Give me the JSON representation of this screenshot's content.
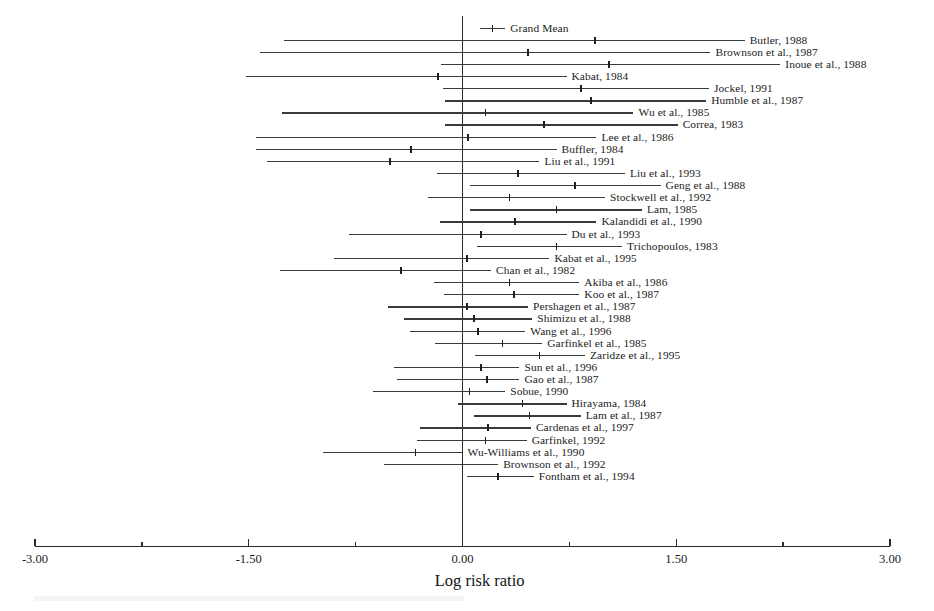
{
  "chart_data": {
    "type": "forest",
    "title": "",
    "xlabel": "Log risk ratio",
    "ylabel": "",
    "xlim": [
      -3.0,
      3.0
    ],
    "xticks": [
      -3.0,
      -1.5,
      0.0,
      1.5,
      3.0
    ],
    "xtick_labels": [
      "-3.00",
      "-1.50",
      "0.00",
      "1.50",
      "3.00"
    ],
    "minor_ticks": [
      -2.25,
      -0.75,
      0.75,
      2.25
    ],
    "grid": false,
    "legend": "none",
    "reference_line": 0.0,
    "summary": {
      "label": "Grand Mean",
      "estimate": 0.21,
      "ci_low": 0.12,
      "ci_high": 0.3,
      "label_side": "right"
    },
    "studies": [
      {
        "label": "Butler, 1988",
        "estimate": 0.93,
        "ci_low": -1.25,
        "ci_high": 1.98,
        "label_side": "right"
      },
      {
        "label": "Brownson et al., 1987",
        "estimate": 0.46,
        "ci_low": -1.42,
        "ci_high": 1.74,
        "label_side": "right"
      },
      {
        "label": "Inoue et al., 1988",
        "estimate": 1.03,
        "ci_low": -0.15,
        "ci_high": 2.23,
        "label_side": "right"
      },
      {
        "label": "Kabat, 1984",
        "estimate": -0.17,
        "ci_low": -1.52,
        "ci_high": 0.73,
        "label_side": "right"
      },
      {
        "label": "Jockel, 1991",
        "estimate": 0.83,
        "ci_low": -0.14,
        "ci_high": 1.73,
        "label_side": "right"
      },
      {
        "label": "Humble et al., 1987",
        "estimate": 0.9,
        "ci_low": -0.12,
        "ci_high": 1.71,
        "label_side": "right"
      },
      {
        "label": "Wu et al., 1985",
        "estimate": 0.16,
        "ci_low": -1.27,
        "ci_high": 1.2,
        "label_side": "right"
      },
      {
        "label": "Correa, 1983",
        "estimate": 0.57,
        "ci_low": -0.12,
        "ci_high": 1.51,
        "label_side": "right"
      },
      {
        "label": "Lee et al., 1986",
        "estimate": 0.04,
        "ci_low": -1.45,
        "ci_high": 0.94,
        "label_side": "right"
      },
      {
        "label": "Buffler, 1984",
        "estimate": -0.36,
        "ci_low": -1.45,
        "ci_high": 0.66,
        "label_side": "right"
      },
      {
        "label": "Liu et al., 1991",
        "estimate": -0.51,
        "ci_low": -1.37,
        "ci_high": 0.54,
        "label_side": "right"
      },
      {
        "label": "Liu et al., 1993",
        "estimate": 0.39,
        "ci_low": -0.18,
        "ci_high": 1.14,
        "label_side": "right"
      },
      {
        "label": "Geng et al., 1988",
        "estimate": 0.79,
        "ci_low": 0.05,
        "ci_high": 1.39,
        "label_side": "right"
      },
      {
        "label": "Stockwell et al., 1992",
        "estimate": 0.33,
        "ci_low": -0.24,
        "ci_high": 1.0,
        "label_side": "right"
      },
      {
        "label": "Lam, 1985",
        "estimate": 0.66,
        "ci_low": 0.05,
        "ci_high": 1.26,
        "label_side": "right"
      },
      {
        "label": "Kalandidi et al., 1990",
        "estimate": 0.37,
        "ci_low": -0.16,
        "ci_high": 0.94,
        "label_side": "right"
      },
      {
        "label": "Du et al., 1993",
        "estimate": 0.13,
        "ci_low": -0.8,
        "ci_high": 0.73,
        "label_side": "right"
      },
      {
        "label": "Trichopoulos, 1983",
        "estimate": 0.66,
        "ci_low": 0.1,
        "ci_high": 1.12,
        "label_side": "right"
      },
      {
        "label": "Kabat et al., 1995",
        "estimate": 0.03,
        "ci_low": -0.9,
        "ci_high": 0.61,
        "label_side": "right"
      },
      {
        "label": "Chan et al., 1982",
        "estimate": -0.43,
        "ci_low": -1.28,
        "ci_high": 0.2,
        "label_side": "right"
      },
      {
        "label": "Akiba et al., 1986",
        "estimate": 0.33,
        "ci_low": -0.2,
        "ci_high": 0.82,
        "label_side": "right"
      },
      {
        "label": "Koo et al., 1987",
        "estimate": 0.36,
        "ci_low": -0.13,
        "ci_high": 0.82,
        "label_side": "right"
      },
      {
        "label": "Pershagen et al., 1987",
        "estimate": 0.03,
        "ci_low": -0.52,
        "ci_high": 0.46,
        "label_side": "right"
      },
      {
        "label": "Shimizu et al., 1988",
        "estimate": 0.08,
        "ci_low": -0.41,
        "ci_high": 0.49,
        "label_side": "right"
      },
      {
        "label": "Wang et al., 1996",
        "estimate": 0.11,
        "ci_low": -0.37,
        "ci_high": 0.44,
        "label_side": "right"
      },
      {
        "label": "Garfinkel et al., 1985",
        "estimate": 0.28,
        "ci_low": -0.19,
        "ci_high": 0.56,
        "label_side": "right"
      },
      {
        "label": "Zaridze et al., 1995",
        "estimate": 0.54,
        "ci_low": 0.09,
        "ci_high": 0.86,
        "label_side": "right"
      },
      {
        "label": "Sun et al., 1996",
        "estimate": 0.13,
        "ci_low": -0.48,
        "ci_high": 0.4,
        "label_side": "right"
      },
      {
        "label": "Gao et al., 1987",
        "estimate": 0.17,
        "ci_low": -0.46,
        "ci_high": 0.4,
        "label_side": "right"
      },
      {
        "label": "Sobue, 1990",
        "estimate": 0.05,
        "ci_low": -0.63,
        "ci_high": 0.3,
        "label_side": "right"
      },
      {
        "label": "Hirayama, 1984",
        "estimate": 0.42,
        "ci_low": -0.03,
        "ci_high": 0.73,
        "label_side": "right"
      },
      {
        "label": "Lam et al., 1987",
        "estimate": 0.47,
        "ci_low": 0.08,
        "ci_high": 0.83,
        "label_side": "right"
      },
      {
        "label": "Cardenas et al., 1997",
        "estimate": 0.18,
        "ci_low": -0.3,
        "ci_high": 0.48,
        "label_side": "right"
      },
      {
        "label": "Garfinkel, 1992",
        "estimate": 0.16,
        "ci_low": -0.32,
        "ci_high": 0.45,
        "label_side": "right"
      },
      {
        "label": "Wu-Williams et al., 1990",
        "estimate": -0.33,
        "ci_low": -0.98,
        "ci_high": 0.0,
        "label_side": "right"
      },
      {
        "label": "Brownson et al., 1992",
        "estimate": 0.0,
        "ci_low": -0.55,
        "ci_high": 0.25,
        "label_side": "right"
      },
      {
        "label": "Fontham et al., 1994",
        "estimate": 0.25,
        "ci_low": 0.03,
        "ci_high": 0.5,
        "label_side": "right"
      }
    ]
  }
}
